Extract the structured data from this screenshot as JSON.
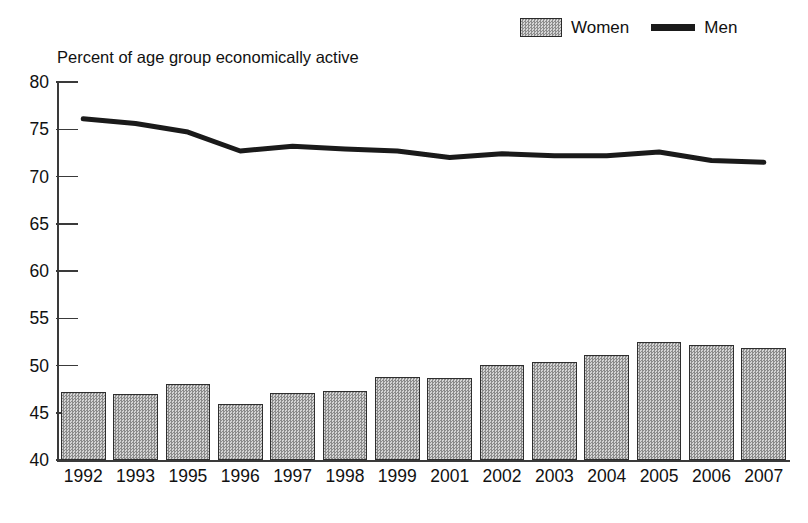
{
  "chart_data": {
    "type": "bar",
    "title": "",
    "ylabel": "Percent of age group economically active",
    "xlabel": "",
    "ylim": [
      40,
      80
    ],
    "yticks": [
      40,
      45,
      50,
      55,
      60,
      65,
      70,
      75,
      80
    ],
    "grid": false,
    "legend_position": "top-right",
    "categories": [
      "1992",
      "1993",
      "1995",
      "1996",
      "1997",
      "1998",
      "1999",
      "2001",
      "2002",
      "2003",
      "2004",
      "2005",
      "2006",
      "2007"
    ],
    "series": [
      {
        "name": "Women",
        "type": "bar",
        "color": "#b0b0b0",
        "values": [
          47.2,
          47.0,
          48.0,
          45.9,
          47.1,
          47.3,
          48.8,
          48.7,
          50.1,
          50.4,
          51.1,
          52.5,
          52.2,
          51.9
        ]
      },
      {
        "name": "Men",
        "type": "line",
        "color": "#1a1a1a",
        "values": [
          76.1,
          75.6,
          74.7,
          72.7,
          73.2,
          72.9,
          72.7,
          72.0,
          72.4,
          72.2,
          72.2,
          72.6,
          71.7,
          71.5
        ]
      }
    ]
  },
  "legend": {
    "items": [
      {
        "label": "Women",
        "marker": "bar-swatch"
      },
      {
        "label": "Men",
        "marker": "line-swatch"
      }
    ]
  },
  "axis": {
    "y_title": "Percent of age group economically active"
  }
}
